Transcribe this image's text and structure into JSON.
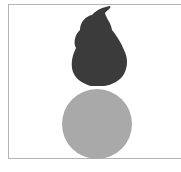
{
  "figure": {
    "colors": {
      "flame": "#3b3b3b",
      "ball": "#a9a9a9",
      "border": "#b4b4b4",
      "background": "#ffffff"
    }
  }
}
